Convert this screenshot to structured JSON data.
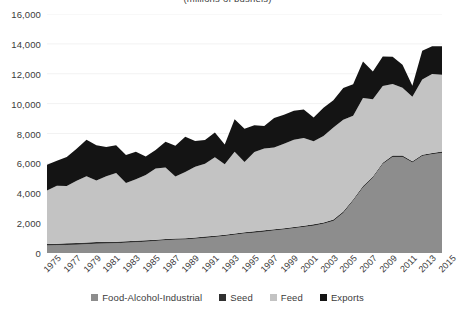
{
  "chart_title": "(millions of bushels)",
  "axes": {
    "y_ticks": [
      "16,000",
      "14,000",
      "12,000",
      "10,000",
      "8,000",
      "6,000",
      "4,000",
      "2,000",
      "0"
    ],
    "x_ticks": [
      "1975",
      "1977",
      "1979",
      "1981",
      "1983",
      "1985",
      "1987",
      "1989",
      "1991",
      "1993",
      "1995",
      "1997",
      "1999",
      "2001",
      "2003",
      "2005",
      "2007",
      "2009",
      "2011",
      "2013",
      "2015"
    ]
  },
  "legend": {
    "items": [
      {
        "label": "Food-Alcohol-Industrial",
        "color": "#8d8d8d",
        "swatch_name": "legend-swatch-food-alcohol-industrial"
      },
      {
        "label": "Seed",
        "color": "#303030",
        "swatch_name": "legend-swatch-seed"
      },
      {
        "label": "Feed",
        "color": "#c3c3c3",
        "swatch_name": "legend-swatch-feed"
      },
      {
        "label": "Exports",
        "color": "#141414",
        "swatch_name": "legend-swatch-exports"
      }
    ]
  },
  "chart_data": {
    "type": "area",
    "stacked": true,
    "title": "(millions of bushels)",
    "xlabel": "",
    "ylabel": "",
    "ylim": [
      0,
      16000
    ],
    "ytick_step": 2000,
    "grid": true,
    "grid_axis": "y",
    "legend_position": "bottom",
    "x": [
      1975,
      1976,
      1977,
      1978,
      1979,
      1980,
      1981,
      1982,
      1983,
      1984,
      1985,
      1986,
      1987,
      1988,
      1989,
      1990,
      1991,
      1992,
      1993,
      1994,
      1995,
      1996,
      1997,
      1998,
      1999,
      2000,
      2001,
      2002,
      2003,
      2004,
      2005,
      2006,
      2007,
      2008,
      2009,
      2010,
      2011,
      2012,
      2013,
      2014,
      2015
    ],
    "categories": [
      "1975",
      "1976",
      "1977",
      "1978",
      "1979",
      "1980",
      "1981",
      "1982",
      "1983",
      "1984",
      "1985",
      "1986",
      "1987",
      "1988",
      "1989",
      "1990",
      "1991",
      "1992",
      "1993",
      "1994",
      "1995",
      "1996",
      "1997",
      "1998",
      "1999",
      "2000",
      "2001",
      "2002",
      "2003",
      "2004",
      "2005",
      "2006",
      "2007",
      "2008",
      "2009",
      "2010",
      "2011",
      "2012",
      "2013",
      "2014",
      "2015"
    ],
    "series": [
      {
        "name": "Food-Alcohol-Industrial",
        "color": "#8d8d8d",
        "values": [
          510,
          520,
          540,
          560,
          590,
          620,
          640,
          660,
          690,
          720,
          760,
          800,
          850,
          880,
          900,
          950,
          1010,
          1070,
          1140,
          1220,
          1300,
          1360,
          1430,
          1500,
          1570,
          1650,
          1740,
          1830,
          1950,
          2150,
          2680,
          3490,
          4390,
          5030,
          5960,
          6430,
          6430,
          6060,
          6490,
          6610,
          6700
        ]
      },
      {
        "name": "Seed",
        "color": "#303030",
        "values": [
          100,
          100,
          105,
          105,
          105,
          110,
          110,
          100,
          100,
          100,
          95,
          90,
          90,
          90,
          90,
          90,
          90,
          90,
          90,
          90,
          90,
          90,
          90,
          90,
          90,
          90,
          90,
          90,
          90,
          90,
          90,
          90,
          90,
          90,
          90,
          90,
          90,
          90,
          90,
          90,
          90
        ]
      },
      {
        "name": "Feed",
        "color": "#c3c3c3",
        "values": [
          3580,
          3880,
          3840,
          4180,
          4450,
          4120,
          4380,
          4590,
          3900,
          4120,
          4370,
          4770,
          4790,
          4150,
          4430,
          4730,
          4880,
          5250,
          4710,
          5460,
          4700,
          5310,
          5480,
          5470,
          5660,
          5840,
          5870,
          5560,
          5790,
          6160,
          6150,
          5600,
          5900,
          5180,
          5130,
          4790,
          4540,
          4310,
          5040,
          5280,
          5150
        ]
      },
      {
        "name": "Exports",
        "color": "#141414",
        "values": [
          1710,
          1680,
          1950,
          2130,
          2430,
          2360,
          1970,
          1870,
          1870,
          1840,
          1240,
          1240,
          1720,
          2060,
          2370,
          1730,
          1580,
          1660,
          1330,
          2180,
          2230,
          1800,
          1500,
          1980,
          1940,
          1940,
          1900,
          1590,
          1900,
          1820,
          2130,
          2120,
          2440,
          1850,
          1980,
          1830,
          1540,
          730,
          1920,
          1860,
          1900
        ]
      }
    ]
  }
}
